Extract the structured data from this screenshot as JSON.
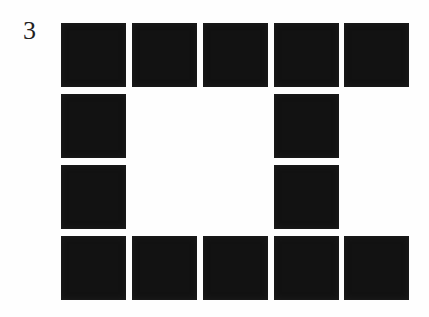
{
  "label": "3",
  "pattern": {
    "columns": 5,
    "rows": 4,
    "fill_color": "#121212",
    "background_color": "#fefefe",
    "cells": [
      [
        1,
        1,
        1,
        1,
        1
      ],
      [
        1,
        0,
        0,
        1,
        0
      ],
      [
        1,
        0,
        0,
        1,
        0
      ],
      [
        1,
        1,
        1,
        1,
        1
      ]
    ]
  }
}
